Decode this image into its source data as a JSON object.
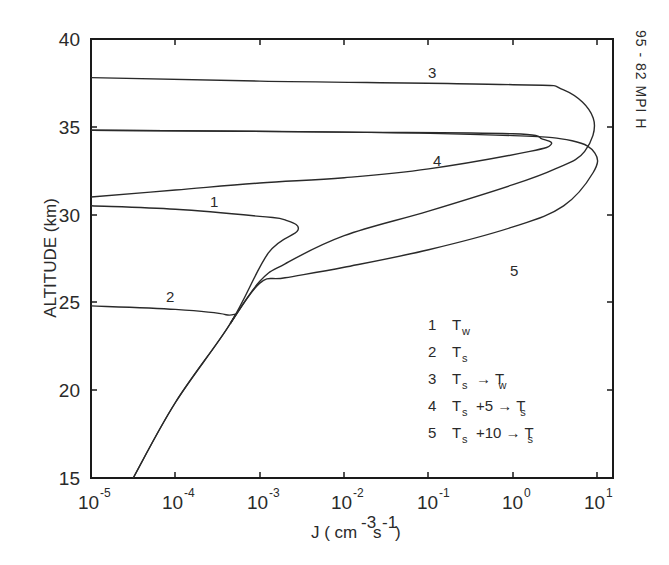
{
  "chart_data": {
    "type": "line",
    "title": "",
    "xlabel": "J (cm^-3 s^-1)",
    "ylabel": "ALTITUDE (km)",
    "xscale": "log",
    "xlim": [
      1e-05,
      15
    ],
    "ylim": [
      15,
      40
    ],
    "grid": false,
    "x_ticks": [
      "10^-5",
      "10^-4",
      "10^-3",
      "10^-2",
      "10^-1",
      "10^0",
      "10^1"
    ],
    "y_ticks": [
      15,
      20,
      25,
      30,
      35,
      40
    ],
    "side_annotation": "95 - 82 MPI H",
    "legend_position": "lower right inside",
    "series": [
      {
        "name": "1",
        "legend": "Tw",
        "points_log10J_alt": [
          [
            -5,
            30.5
          ],
          [
            -4,
            30.3
          ],
          [
            -3,
            29.9
          ],
          [
            -2.7,
            29.7
          ],
          [
            -2.55,
            29.1
          ],
          [
            -2.9,
            27.8
          ],
          [
            -3.35,
            23.8
          ],
          [
            -4.0,
            19.3
          ],
          [
            -4.5,
            15
          ]
        ]
      },
      {
        "name": "2",
        "legend": "Ts",
        "points_log10J_alt": [
          [
            -5,
            24.8
          ],
          [
            -4,
            24.6
          ],
          [
            -3.4,
            24.3
          ],
          [
            -3.35,
            23.8
          ],
          [
            -4.0,
            19.3
          ],
          [
            -4.5,
            15
          ]
        ]
      },
      {
        "name": "3",
        "legend": "Ts → Tw",
        "points_log10J_alt": [
          [
            -5,
            37.8
          ],
          [
            -3,
            37.6
          ],
          [
            0,
            37.4
          ],
          [
            0.6,
            37.1
          ],
          [
            0.95,
            35.5
          ],
          [
            0.85,
            33.6
          ],
          [
            0.5,
            32.6
          ],
          [
            0,
            31.7
          ],
          [
            -1,
            30.2
          ],
          [
            -2,
            28.8
          ],
          [
            -2.7,
            27.2
          ],
          [
            -3.0,
            26.2
          ],
          [
            -3.35,
            23.8
          ]
        ]
      },
      {
        "name": "4",
        "legend": "Ts +5 → Ts",
        "points_log10J_alt": [
          [
            -5,
            34.8
          ],
          [
            -2,
            34.7
          ],
          [
            0,
            34.6
          ],
          [
            0.35,
            34.3
          ],
          [
            0.45,
            34.0
          ],
          [
            0.2,
            33.6
          ],
          [
            -1,
            32.6
          ],
          [
            -2,
            32.1
          ],
          [
            -3,
            31.8
          ],
          [
            -4,
            31.4
          ],
          [
            -5,
            31.0
          ]
        ]
      },
      {
        "name": "5",
        "legend": "Ts +10 → Ts",
        "points_log10J_alt": [
          [
            -5,
            34.8
          ],
          [
            -2,
            34.7
          ],
          [
            0,
            34.5
          ],
          [
            0.7,
            34.2
          ],
          [
            0.97,
            33.5
          ],
          [
            0.95,
            32.4
          ],
          [
            0.6,
            30.5
          ],
          [
            0,
            29.3
          ],
          [
            -1,
            28.0
          ],
          [
            -2,
            27.0
          ],
          [
            -2.7,
            26.4
          ],
          [
            -3.0,
            26.1
          ],
          [
            -3.35,
            23.8
          ]
        ]
      }
    ],
    "legend_entries": [
      {
        "num": "1",
        "label": "T",
        "sub": "w",
        "rest": ""
      },
      {
        "num": "2",
        "label": "T",
        "sub": "s",
        "rest": ""
      },
      {
        "num": "3",
        "label": "T",
        "sub": "s",
        "rest": "→ T",
        "rest_sub": "w"
      },
      {
        "num": "4",
        "label": "T",
        "sub": "s",
        "rest": "+5 → T",
        "rest_sub": "s"
      },
      {
        "num": "5",
        "label": "T",
        "sub": "s",
        "rest": "+10 → T",
        "rest_sub": "s"
      }
    ]
  },
  "axes": {
    "y_label": "ALTITUDE (km)",
    "x_label_main": "J ( cm",
    "x_label_sup1": "-3",
    "x_label_s": "s",
    "x_label_sup2": "-1",
    "x_label_close": ")",
    "y_ticks": [
      "40",
      "35",
      "30",
      "25",
      "20",
      "15"
    ],
    "x_tick_base": "10",
    "x_tick_exps": [
      "-5",
      "-4",
      "-3",
      "-2",
      "-1",
      "0",
      "1"
    ]
  },
  "curve_labels": [
    "1",
    "2",
    "3",
    "4",
    "5"
  ],
  "side_note": "95 - 82 MPI H"
}
